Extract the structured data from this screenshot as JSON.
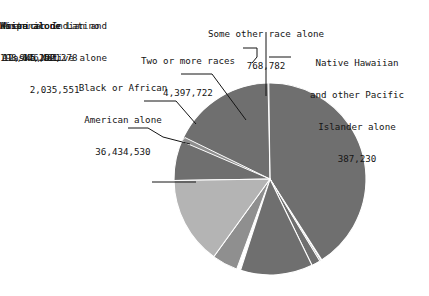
{
  "chart_data": {
    "type": "pie",
    "title": "",
    "subtitle": "",
    "xlabel": "",
    "ylabel": "",
    "grid": false,
    "legend_position": "none",
    "label_style": "external labels with leader lines",
    "total": 299397705,
    "categories": [
      "White alone",
      "Hispanic or Latino",
      "Black or African American alone",
      "Asian alone",
      "Two or more races",
      "American Indian and Alaska Native alone",
      "Some other race alone",
      "Native Hawaiian and other Pacific Islander alone"
    ],
    "values": [
      198176991,
      44252278,
      36434530,
      12945401,
      4397722,
      2035551,
      768782,
      387230
    ],
    "value_labels": [
      "198,176,991",
      "44,252,278",
      "36,434,530",
      "12,945,401",
      "4,397,722",
      "2,035,551",
      "768,782",
      "387,230"
    ],
    "percentages": [
      66.19,
      14.78,
      12.17,
      4.32,
      1.47,
      0.68,
      0.26,
      0.13
    ],
    "slices": [
      {
        "name": "White alone",
        "value": 198176991,
        "value_label": "198,176,991",
        "percent": 66.19,
        "color": "#6f6f6f",
        "label_position": "inside-right"
      },
      {
        "name": "Hispanic or Latino",
        "value": 44252278,
        "value_label": "44,252,278",
        "percent": 14.78,
        "color": "#b4b4b4",
        "label_position": "left"
      },
      {
        "name": "Black or African American alone",
        "value": 36434530,
        "value_label": "36,434,530",
        "percent": 12.17,
        "color": "#6f6f6f",
        "label_position": "upper-left"
      },
      {
        "name": "Asian alone",
        "value": 12945401,
        "value_label": "12,945,401",
        "percent": 4.32,
        "color": "#8f8f8f",
        "label_position": "left"
      },
      {
        "name": "Two or more races",
        "value": 4397722,
        "value_label": "4,397,722",
        "percent": 1.47,
        "color": "#6f6f6f",
        "label_position": "top-left"
      },
      {
        "name": "American Indian and Alaska Native alone",
        "value": 2035551,
        "value_label": "2,035,551",
        "percent": 0.68,
        "color": "#8f8f8f",
        "label_position": "left"
      },
      {
        "name": "Some other race alone",
        "value": 768782,
        "value_label": "768,782",
        "percent": 0.26,
        "color": "#a8a8a8",
        "label_position": "top"
      },
      {
        "name": "Native Hawaiian and other Pacific Islander alone",
        "value": 387230,
        "value_label": "387,230",
        "percent": 0.13,
        "color": "#6f6f6f",
        "label_position": "top-right"
      }
    ],
    "colors": {
      "dark_gray": "#6f6f6f",
      "mid_gray": "#8f8f8f",
      "light_gray": "#b4b4b4",
      "pale_gray": "#a8a8a8",
      "separator": "#ffffff",
      "leader_line": "#151515",
      "text": "#151515",
      "background": "#ffffff"
    }
  },
  "labels": {
    "some_other_race": {
      "name": "Some other race alone",
      "value": "768,782"
    },
    "two_or_more": {
      "name": "Two or more races",
      "value": "4,397,722"
    },
    "nhpi": {
      "line1": "Native Hawaiian",
      "line2": "and other Pacific",
      "line3": "Islander alone",
      "value": "387,230"
    },
    "black": {
      "line1": "Black or African",
      "line2": "American alone",
      "value": "36,434,530"
    },
    "aian": {
      "line1": "American Indian and",
      "line2": "Alaska Native alone",
      "value": "2,035,551"
    },
    "asian": {
      "name": "Asian alone",
      "value": "12,945,401"
    },
    "hispanic": {
      "name": "Hispanic or Latino",
      "value": "44,252,278"
    },
    "white": {
      "name": "White alone",
      "value": "198,176,991"
    }
  }
}
